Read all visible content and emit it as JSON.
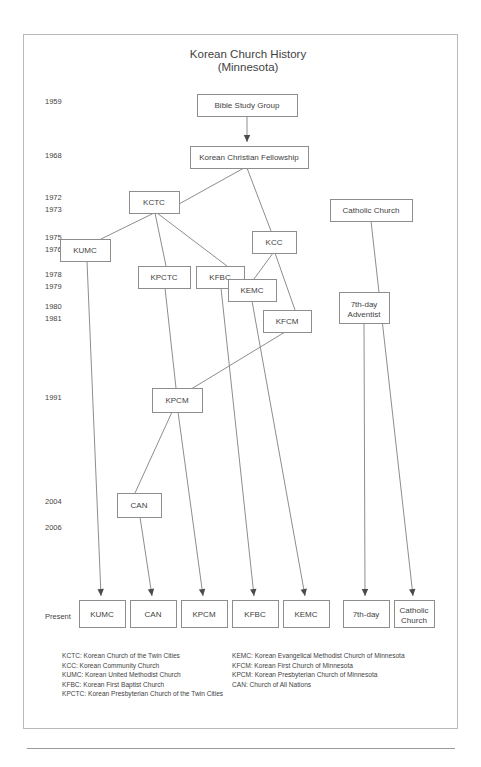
{
  "title": {
    "line1": "Korean Church History",
    "line2": "(Minnesota)"
  },
  "timeline": {
    "label_present": "Present",
    "years": [
      {
        "year": "1959",
        "y": 104
      },
      {
        "year": "1968",
        "y": 158
      },
      {
        "year": "1972",
        "y": 200
      },
      {
        "year": "1973",
        "y": 212
      },
      {
        "year": "1975",
        "y": 240
      },
      {
        "year": "1976",
        "y": 252
      },
      {
        "year": "1978",
        "y": 277
      },
      {
        "year": "1979",
        "y": 289
      },
      {
        "year": "1980",
        "y": 309
      },
      {
        "year": "1981",
        "y": 321
      },
      {
        "year": "1991",
        "y": 400
      },
      {
        "year": "2004",
        "y": 504
      },
      {
        "year": "2006",
        "y": 530
      }
    ]
  },
  "nodes": [
    {
      "id": "bsg",
      "label": "Bible Study Group",
      "x": 197,
      "y": 94,
      "w": 100,
      "h": 22
    },
    {
      "id": "kcf",
      "label": "Korean Christian Fellowship",
      "x": 190,
      "y": 146,
      "w": 118,
      "h": 22
    },
    {
      "id": "kctc",
      "label": "KCTC",
      "x": 129,
      "y": 191,
      "w": 50,
      "h": 22
    },
    {
      "id": "cath",
      "label": "Catholic Church",
      "x": 330,
      "y": 199,
      "w": 82,
      "h": 22
    },
    {
      "id": "kumc",
      "label": "KUMC",
      "x": 60,
      "y": 239,
      "w": 50,
      "h": 22
    },
    {
      "id": "kcc",
      "label": "KCC",
      "x": 252,
      "y": 231,
      "w": 44,
      "h": 22
    },
    {
      "id": "kpctc",
      "label": "KPCTC",
      "x": 138,
      "y": 266,
      "w": 52,
      "h": 22
    },
    {
      "id": "kfbc",
      "label": "KFBC",
      "x": 196,
      "y": 266,
      "w": 48,
      "h": 22
    },
    {
      "id": "kemc",
      "label": "KEMC",
      "x": 228,
      "y": 279,
      "w": 48,
      "h": 22
    },
    {
      "id": "adv",
      "label": "7th-day Adventist",
      "x": 339,
      "y": 292,
      "w": 50,
      "h": 31
    },
    {
      "id": "kfcm",
      "label": "KFCM",
      "x": 263,
      "y": 310,
      "w": 48,
      "h": 22
    },
    {
      "id": "kpcm",
      "label": "KPCM",
      "x": 152,
      "y": 388,
      "w": 50,
      "h": 24
    },
    {
      "id": "can",
      "label": "CAN",
      "x": 117,
      "y": 493,
      "w": 44,
      "h": 24
    }
  ],
  "bottom_nodes": [
    {
      "id": "b_kumc",
      "label": "KUMC",
      "x": 79,
      "y": 600,
      "w": 46,
      "h": 27
    },
    {
      "id": "b_can",
      "label": "CAN",
      "x": 130,
      "y": 600,
      "w": 46,
      "h": 27
    },
    {
      "id": "b_kpcm",
      "label": "KPCM",
      "x": 181,
      "y": 600,
      "w": 46,
      "h": 27
    },
    {
      "id": "b_kfbc",
      "label": "KFBC",
      "x": 232,
      "y": 600,
      "w": 46,
      "h": 27
    },
    {
      "id": "b_kemc",
      "label": "KEMC",
      "x": 283,
      "y": 600,
      "w": 46,
      "h": 27
    },
    {
      "id": "b_adv",
      "label": "7th-day",
      "x": 343,
      "y": 600,
      "w": 46,
      "h": 27
    },
    {
      "id": "b_cath",
      "label": "Catholic Church",
      "x": 394,
      "y": 600,
      "w": 40,
      "h": 27
    }
  ],
  "edges": [
    {
      "from": "bsg",
      "to": "kcf",
      "arrow": true,
      "path": "M 247 116 L 247 142"
    },
    {
      "from": "kcf",
      "to": "kctc",
      "arrow": false,
      "path": "M 244 168 L 179 204"
    },
    {
      "from": "kcf",
      "to": "kcc",
      "arrow": false,
      "path": "M 247 168 L 271 231"
    },
    {
      "from": "kctc",
      "to": "kumc",
      "arrow": false,
      "path": "M 154 213 L 101 239"
    },
    {
      "from": "kctc",
      "to": "kpctc",
      "arrow": false,
      "path": "M 155 213 L 166 266"
    },
    {
      "from": "kctc",
      "to": "kfbc",
      "arrow": false,
      "path": "M 157 213 L 227 266"
    },
    {
      "from": "kcc",
      "to": "kemc",
      "arrow": false,
      "path": "M 273 253 L 254 279"
    },
    {
      "from": "kcc",
      "to": "kfcm",
      "arrow": false,
      "path": "M 275 253 L 295 310"
    },
    {
      "from": "kfcm",
      "to": "kpcm",
      "arrow": false,
      "path": "M 285 332 L 183 394"
    },
    {
      "from": "kpctc",
      "to": "kpcm",
      "arrow": false,
      "path": "M 165 288 L 176 388"
    },
    {
      "from": "kpcm",
      "to": "can",
      "arrow": false,
      "path": "M 172 412 L 135 493"
    },
    {
      "from": "kumc",
      "to": "b_kumc",
      "arrow": true,
      "path": "M 87 261 L 101 596"
    },
    {
      "from": "can",
      "to": "b_can",
      "arrow": true,
      "path": "M 140 517 L 152 596"
    },
    {
      "from": "kpcm",
      "to": "b_kpcm",
      "arrow": true,
      "path": "M 178 412 L 203 596"
    },
    {
      "from": "kfbc",
      "to": "b_kfbc",
      "arrow": true,
      "path": "M 221 288 L 254 596"
    },
    {
      "from": "kemc",
      "to": "b_kemc",
      "arrow": true,
      "path": "M 252 301 L 305 596"
    },
    {
      "from": "adv",
      "to": "b_adv",
      "arrow": true,
      "path": "M 364 323 L 365 596"
    },
    {
      "from": "cath",
      "to": "b_cath",
      "arrow": true,
      "path": "M 371 221 L 413 596"
    }
  ],
  "legend": {
    "left": [
      "KCTC: Korean Church of the Twin Cities",
      "KCC: Korean Community Church",
      "KUMC: Korean United Methodist Church",
      "KFBC: Korean First Baptist Church",
      "KPCTC: Korean Presbyterian Church of the Twin Cities"
    ],
    "right": [
      "KEMC: Korean Evangelical Methodist Church of Minnesota",
      "KFCM: Korean First Church of Minnesota",
      "KPCM: Korean Presbyterian Church of Minnesota",
      "CAN: Church of All Nations"
    ]
  },
  "colors": {
    "frame": "#b9b9b9",
    "box_stroke": "#8d8d8d",
    "text": "#3f3f3f",
    "background": "#ffffff"
  }
}
